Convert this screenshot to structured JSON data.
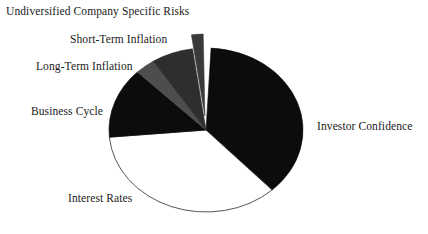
{
  "chart_data": {
    "type": "pie",
    "title": "",
    "subtitle": "",
    "xlabel": "",
    "ylabel": "",
    "legend_position": "none",
    "grid": false,
    "labels_outside": true,
    "start_angle_deg": 0,
    "direction": "clockwise",
    "categories": [
      "Investor Confidence",
      "Interest Rates",
      "Business Cycle",
      "Long-Term Inflation",
      "Short-Term Inflation",
      "Undiversified Company Specific Risks"
    ],
    "values": [
      37,
      36,
      14,
      3.5,
      7,
      2.5
    ],
    "slices": [
      {
        "label": "Investor Confidence",
        "value": 37,
        "start_deg": 3,
        "end_deg": 137,
        "fill": "#0c0c0c",
        "stroke": "#0c0c0c",
        "exploded": false
      },
      {
        "label": "Interest Rates",
        "value": 36,
        "start_deg": 137,
        "end_deg": 265,
        "fill": "#ffffff",
        "stroke": "#2b2b2b",
        "exploded": false
      },
      {
        "label": "Business Cycle",
        "value": 14,
        "start_deg": 265,
        "end_deg": 315,
        "fill": "#0c0c0c",
        "stroke": "#0c0c0c",
        "exploded": false
      },
      {
        "label": "Long-Term Inflation",
        "value": 3.5,
        "start_deg": 315,
        "end_deg": 327,
        "fill": "#4d4d4d",
        "stroke": "#4d4d4d",
        "exploded": false
      },
      {
        "label": "Short-Term Inflation",
        "value": 7,
        "start_deg": 327,
        "end_deg": 352,
        "fill": "#2e2e2e",
        "stroke": "#2e2e2e",
        "exploded": false
      },
      {
        "label": "Undiversified Company Specific Risks",
        "value": 2.5,
        "start_deg": 352,
        "end_deg": 359,
        "fill": "#3a3a3a",
        "stroke": "#3a3a3a",
        "exploded": true
      }
    ],
    "geometry": {
      "center_x": 206,
      "center_y": 130,
      "radius_x": 97,
      "radius_y": 82,
      "explode_offset": 14
    }
  },
  "labels": {
    "undiversified": "Undiversified Company Specific Risks",
    "short_term": "Short-Term Inflation",
    "long_term": "Long-Term Inflation",
    "business_cycle": "Business Cycle",
    "interest_rates": "Interest Rates",
    "investor_confidence": "Investor Confidence"
  },
  "colors": {
    "background": "#ffffff",
    "text": "#1a1a1a",
    "black_slice": "#0c0c0c",
    "white_slice": "#ffffff",
    "dark_gray_slice": "#2e2e2e",
    "mid_gray_slice": "#4d4d4d",
    "exploded_slice": "#3a3a3a",
    "outline": "#2b2b2b"
  }
}
